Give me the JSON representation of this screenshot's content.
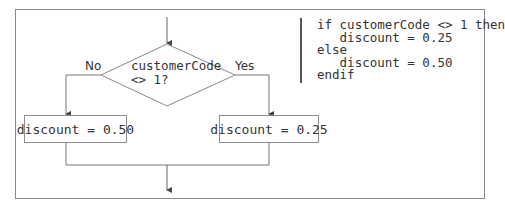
{
  "flowchart": {
    "decision": {
      "line1": "customerCode",
      "line2": "<> 1?"
    },
    "branch_no_label": "No",
    "branch_yes_label": "Yes",
    "no_action": "discount = 0.50",
    "yes_action": "discount = 0.25"
  },
  "pseudocode": {
    "lines": [
      "if customerCode <> 1 then",
      "   discount = 0.25",
      "else",
      "   discount = 0.50",
      "endif"
    ]
  },
  "colors": {
    "line": "#7a7a7a",
    "frame": "#8a8a8a",
    "bar": "#555555",
    "text": "#333333"
  }
}
